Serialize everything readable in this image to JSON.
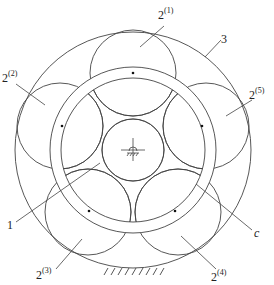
{
  "diagram": {
    "type": "planetary-gear-schematic",
    "center": [
      133,
      150
    ],
    "ring_gear": {
      "id": "3",
      "radius": 118
    },
    "carrier": {
      "id": "c",
      "outer_radius": 83,
      "inner_radius": 72
    },
    "sun_gear": {
      "id": "1",
      "radius": 31
    },
    "planet_radius": 43,
    "planet_orbit_radius": 77,
    "planets": [
      {
        "id": "2(1)",
        "cx": 133,
        "cy": 73
      },
      {
        "id": "2(2)",
        "cx": 60,
        "cy": 126
      },
      {
        "id": "2(3)",
        "cx": 88,
        "cy": 212
      },
      {
        "id": "2(4)",
        "cx": 178,
        "cy": 212
      },
      {
        "id": "2(5)",
        "cx": 206,
        "cy": 126
      }
    ],
    "stroke_color": "#444444",
    "ground": {
      "x1": 102,
      "x2": 162,
      "y": 268
    }
  },
  "labels": {
    "planet1": {
      "base": "2",
      "sup": "(1)"
    },
    "planet2": {
      "base": "2",
      "sup": "(2)"
    },
    "planet3": {
      "base": "2",
      "sup": "(3)"
    },
    "planet4": {
      "base": "2",
      "sup": "(4)"
    },
    "planet5": {
      "base": "2",
      "sup": "(5)"
    },
    "ring": "3",
    "sun": "1",
    "carrier": "c"
  }
}
